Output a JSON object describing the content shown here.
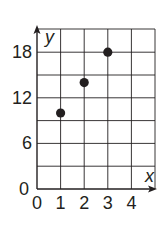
{
  "chart_data": {
    "type": "scatter",
    "title": "",
    "xlabel": "x",
    "ylabel": "y",
    "xlim": [
      0,
      5
    ],
    "ylim": [
      0,
      21
    ],
    "x_ticks": [
      0,
      1,
      2,
      3,
      4
    ],
    "y_ticks": [
      0,
      6,
      12,
      18
    ],
    "grid": true,
    "grid_x_step": 1,
    "grid_y_step": 3,
    "legend": null,
    "series": [
      {
        "name": "points",
        "x": [
          1,
          2,
          3
        ],
        "y": [
          10,
          14,
          18
        ]
      }
    ],
    "colors": {
      "ink": "#231f20",
      "grid": "#231f20",
      "background": "#ffffff"
    }
  }
}
